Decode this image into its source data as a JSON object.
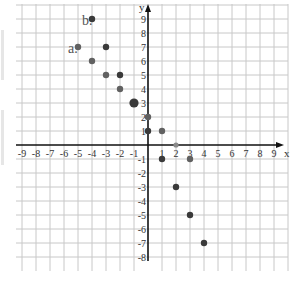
{
  "chart_data": {
    "type": "scatter",
    "title": "",
    "xlabel": "x",
    "ylabel": "y",
    "xlim": [
      -9,
      9
    ],
    "ylim": [
      -8,
      9
    ],
    "grid": true,
    "x_ticks": [
      -9,
      -8,
      -7,
      -6,
      -5,
      -4,
      -3,
      -2,
      -1,
      1,
      2,
      3,
      4,
      5,
      6,
      7,
      8,
      9
    ],
    "y_ticks": [
      -8,
      -7,
      -6,
      -5,
      -4,
      -3,
      -2,
      -1,
      1,
      2,
      3,
      4,
      5,
      6,
      7,
      8,
      9
    ],
    "annotations": [
      {
        "text": "a.",
        "x": -5,
        "y": 7
      },
      {
        "text": "b.",
        "x": -4,
        "y": 9
      }
    ],
    "points": [
      {
        "x": -4,
        "y": 9,
        "shade": "dark",
        "size": "normal"
      },
      {
        "x": -5,
        "y": 7,
        "shade": "medium",
        "size": "normal"
      },
      {
        "x": -3,
        "y": 7,
        "shade": "dark",
        "size": "normal"
      },
      {
        "x": -4,
        "y": 6,
        "shade": "medium",
        "size": "normal"
      },
      {
        "x": -3,
        "y": 5,
        "shade": "medium",
        "size": "normal"
      },
      {
        "x": -2,
        "y": 5,
        "shade": "dark",
        "size": "normal"
      },
      {
        "x": -2,
        "y": 4,
        "shade": "medium",
        "size": "normal"
      },
      {
        "x": -1,
        "y": 3,
        "shade": "dark",
        "size": "large"
      },
      {
        "x": 0,
        "y": 2,
        "shade": "medium",
        "size": "normal"
      },
      {
        "x": 0,
        "y": 1,
        "shade": "dark",
        "size": "normal"
      },
      {
        "x": 1,
        "y": 1,
        "shade": "medium",
        "size": "normal"
      },
      {
        "x": 2,
        "y": 0,
        "shade": "light",
        "size": "small"
      },
      {
        "x": 1,
        "y": -1,
        "shade": "dark",
        "size": "normal"
      },
      {
        "x": 3,
        "y": -1,
        "shade": "medium",
        "size": "normal"
      },
      {
        "x": 2,
        "y": -3,
        "shade": "dark",
        "size": "normal"
      },
      {
        "x": 3,
        "y": -5,
        "shade": "dark",
        "size": "normal"
      },
      {
        "x": 4,
        "y": -7,
        "shade": "dark",
        "size": "normal"
      }
    ],
    "colors": {
      "dark": "#3a3a3a",
      "medium": "#616161",
      "light": "#8a8a8a",
      "grid": "#c8c8c8",
      "axis": "#111111"
    }
  }
}
